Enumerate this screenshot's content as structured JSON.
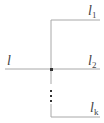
{
  "diagram": {
    "colors": {
      "line": "#a8a8a8",
      "node": "#333333",
      "text": "#444444"
    },
    "labels": {
      "input": {
        "base": "l",
        "sub": ""
      },
      "out1": {
        "base": "l",
        "sub": "1"
      },
      "out2": {
        "base": "l",
        "sub": "2"
      },
      "outk": {
        "base": "l",
        "sub": "k"
      }
    },
    "ellipsis": "⋮"
  }
}
